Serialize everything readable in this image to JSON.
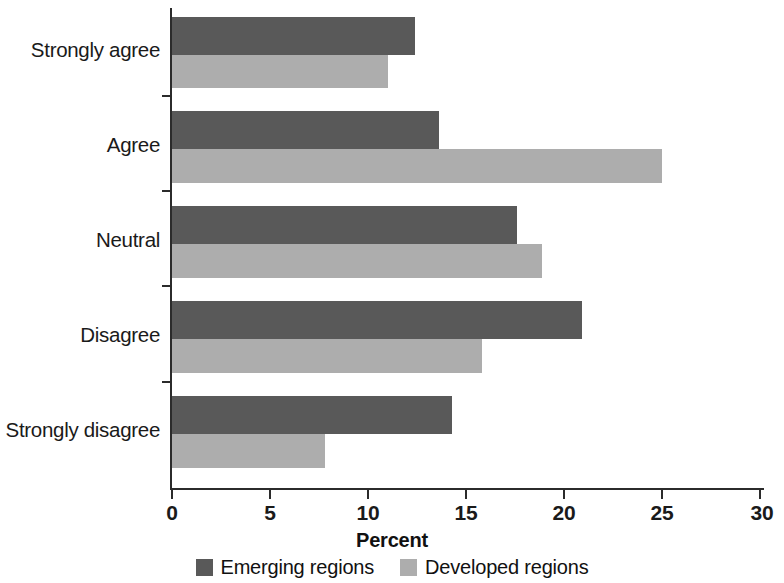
{
  "chart_data": {
    "type": "bar",
    "orientation": "horizontal",
    "title": "",
    "xlabel": "Percent",
    "ylabel": "",
    "xlim": [
      0,
      30
    ],
    "xticks": [
      0,
      5,
      10,
      15,
      20,
      25,
      30
    ],
    "xtick_labels": [
      "0",
      "5",
      "10",
      "15",
      "20",
      "25",
      "30"
    ],
    "grid": false,
    "legend_position": "bottom-center",
    "categories": [
      "Strongly agree",
      "Agree",
      "Neutral",
      "Disagree",
      "Strongly disagree"
    ],
    "series": [
      {
        "name": "Emerging regions",
        "color": "#595959",
        "values": [
          12.4,
          13.6,
          17.6,
          20.9,
          14.3
        ]
      },
      {
        "name": "Developed regions",
        "color": "#adadad",
        "values": [
          11.0,
          25.0,
          18.9,
          15.8,
          7.8
        ]
      }
    ]
  },
  "axis": {
    "x_title": "Percent",
    "ticks": [
      {
        "value": 0,
        "label": "0"
      },
      {
        "value": 5,
        "label": "5"
      },
      {
        "value": 10,
        "label": "10"
      },
      {
        "value": 15,
        "label": "15"
      },
      {
        "value": 20,
        "label": "20"
      },
      {
        "value": 25,
        "label": "25"
      },
      {
        "value": 30,
        "label": "30"
      }
    ],
    "categories": [
      {
        "label": "Strongly agree"
      },
      {
        "label": "Agree"
      },
      {
        "label": "Neutral"
      },
      {
        "label": "Disagree"
      },
      {
        "label": "Strongly disagree"
      }
    ]
  },
  "legend": {
    "items": [
      {
        "label": "Emerging regions",
        "color": "#595959"
      },
      {
        "label": "Developed regions",
        "color": "#adadad"
      }
    ]
  }
}
